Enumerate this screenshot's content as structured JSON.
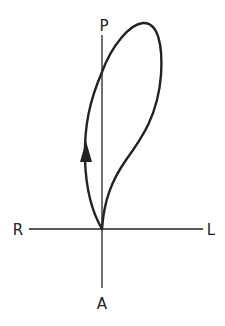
{
  "diagram": {
    "type": "vector-loop-diagram",
    "axes": {
      "vertical": {
        "top_label": "P",
        "bottom_label": "A"
      },
      "horizontal": {
        "left_label": "R",
        "right_label": "L"
      }
    },
    "loop": {
      "direction_indicator": "arrow-up-on-left-limb",
      "description": "Elongated counter-clockwise loop originating at the origin, extending upward and toward L"
    },
    "colors": {
      "background": "#ffffff",
      "stroke": "#222222"
    }
  }
}
